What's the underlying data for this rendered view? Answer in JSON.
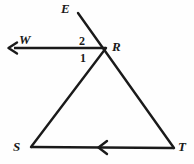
{
  "figure": {
    "kind": "geometry-diagram",
    "width": 194,
    "height": 164,
    "background_color": "#fefefe",
    "stroke_color": "#1a1a1a",
    "labels": {
      "E": "E",
      "W": "W",
      "R": "R",
      "S": "S",
      "T": "T",
      "angle_2": "2",
      "angle_1": "1"
    },
    "points": {
      "E": {
        "x": 78,
        "y": 13
      },
      "R": {
        "x": 106,
        "y": 48
      },
      "S": {
        "x": 31,
        "y": 147
      },
      "T": {
        "x": 174,
        "y": 148
      },
      "W_arrow_tip": {
        "x": 9,
        "y": 48
      }
    },
    "segments": [
      {
        "name": "line-E-R-T",
        "from": "E",
        "to": "T",
        "through": "R"
      },
      {
        "name": "segment-R-S",
        "from": "R",
        "to": "S"
      },
      {
        "name": "segment-S-T",
        "from": "S",
        "to": "T"
      },
      {
        "name": "ray-R-W",
        "from": "R",
        "to": "W_arrow_tip"
      }
    ],
    "arrowheads": [
      {
        "name": "arrowhead-W",
        "on": "ray-R-W",
        "direction": "left",
        "at_end": true
      },
      {
        "name": "arrowhead-ST-midpoint",
        "on": "segment-S-T",
        "direction": "left",
        "at_end": false
      }
    ]
  }
}
